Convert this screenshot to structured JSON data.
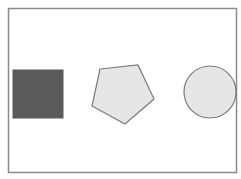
{
  "canvas": {
    "background": "#ffffff",
    "frame": {
      "x": 8.5,
      "y": 8.5,
      "width": 228,
      "height": 164,
      "stroke": "#8a8a8a",
      "fill": "#ffffff"
    }
  },
  "shapes": [
    {
      "type": "square",
      "label": "dark square",
      "x": 13,
      "y": 70,
      "width": 50,
      "height": 48,
      "fill": "#5a5a5a",
      "stroke": "#5a5a5a"
    },
    {
      "type": "pentagon",
      "label": "light pentagon",
      "points": "100,69 138,65 154,99 125,124 92,106",
      "fill": "#e6e6e6",
      "stroke": "#7a7a7a"
    },
    {
      "type": "circle",
      "label": "light circle",
      "cx": 210,
      "cy": 92,
      "r": 26,
      "fill": "#e6e6e6",
      "stroke": "#7a7a7a"
    }
  ]
}
